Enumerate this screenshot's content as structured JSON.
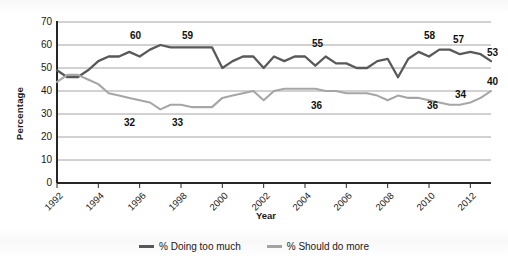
{
  "axes": {
    "ylabel": "Percentage",
    "xlabel": "Year",
    "yticks": [
      "0",
      "10",
      "20",
      "30",
      "40",
      "50",
      "60",
      "70"
    ],
    "xticks": [
      "1992",
      "1994",
      "1996",
      "1998",
      "2000",
      "2002",
      "2004",
      "2006",
      "2008",
      "2010",
      "2012"
    ]
  },
  "legend": {
    "items": [
      {
        "label": "% Doing too much",
        "color": "#595959"
      },
      {
        "label": "% Should do more",
        "color": "#a6a6a6"
      }
    ]
  },
  "annotations": [
    {
      "text": "60",
      "series": "doing-too-much",
      "year": 1996,
      "value": 60,
      "x": 130,
      "y": 30
    },
    {
      "text": "59",
      "series": "doing-too-much",
      "year": 1999,
      "value": 59,
      "x": 182,
      "y": 30
    },
    {
      "text": "55",
      "series": "doing-too-much",
      "year": 2004,
      "value": 55,
      "x": 312,
      "y": 38
    },
    {
      "text": "58",
      "series": "doing-too-much",
      "year": 2010,
      "value": 58,
      "x": 424,
      "y": 30
    },
    {
      "text": "57",
      "series": "doing-too-much",
      "year": 2011,
      "value": 57,
      "x": 453,
      "y": 34
    },
    {
      "text": "53",
      "series": "doing-too-much",
      "year": 2013,
      "value": 53,
      "x": 487,
      "y": 47
    },
    {
      "text": "32",
      "series": "should-do-more",
      "year": 1996,
      "value": 32,
      "x": 124,
      "y": 117
    },
    {
      "text": "33",
      "series": "should-do-more",
      "year": 1999,
      "value": 33,
      "x": 172,
      "y": 117
    },
    {
      "text": "36",
      "series": "should-do-more",
      "year": 2003,
      "value": 36,
      "x": 311,
      "y": 100
    },
    {
      "text": "36",
      "series": "should-do-more",
      "year": 2010,
      "value": 36,
      "x": 427,
      "y": 100
    },
    {
      "text": "34",
      "series": "should-do-more",
      "year": 2011,
      "value": 34,
      "x": 455,
      "y": 89
    },
    {
      "text": "40",
      "series": "should-do-more",
      "year": 2013,
      "value": 40,
      "x": 487,
      "y": 76
    }
  ],
  "chart_data": {
    "type": "line",
    "title": "",
    "xlabel": "Year",
    "ylabel": "Percentage",
    "ylim": [
      0,
      70
    ],
    "xlim": [
      1992,
      2013
    ],
    "grid": true,
    "legend_position": "bottom",
    "x": [
      1992,
      1992.5,
      1993,
      1993.5,
      1994,
      1994.5,
      1995,
      1995.5,
      1996,
      1996.5,
      1997,
      1997.5,
      1998,
      1998.5,
      1999,
      1999.5,
      2000,
      2000.5,
      2001,
      2001.5,
      2002,
      2002.5,
      2003,
      2003.5,
      2004,
      2004.5,
      2005,
      2005.5,
      2006,
      2006.5,
      2007,
      2007.5,
      2008,
      2008.5,
      2009,
      2009.5,
      2010,
      2010.5,
      2011,
      2011.5,
      2012,
      2012.5,
      2013
    ],
    "series": [
      {
        "name": "% Doing too much",
        "color": "#595959",
        "values": [
          49,
          46,
          46,
          49,
          53,
          55,
          55,
          57,
          55,
          58,
          60,
          59,
          59,
          59,
          59,
          59,
          50,
          53,
          55,
          55,
          50,
          55,
          53,
          55,
          55,
          51,
          55,
          52,
          52,
          50,
          50,
          53,
          54,
          46,
          54,
          57,
          55,
          58,
          58,
          56,
          57,
          56,
          53
        ]
      },
      {
        "name": "% Should do more",
        "color": "#a6a6a6",
        "values": [
          44,
          47,
          47,
          45,
          43,
          39,
          38,
          37,
          36,
          35,
          32,
          34,
          34,
          33,
          33,
          33,
          37,
          38,
          39,
          40,
          36,
          40,
          41,
          41,
          41,
          41,
          40,
          40,
          39,
          39,
          39,
          38,
          36,
          38,
          37,
          37,
          36,
          35,
          34,
          34,
          35,
          37,
          40
        ]
      }
    ]
  }
}
